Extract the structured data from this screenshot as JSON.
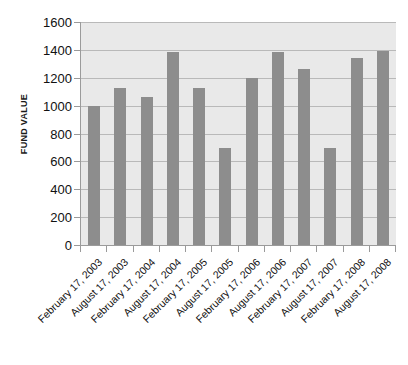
{
  "chart_data": {
    "type": "bar",
    "title": "",
    "xlabel": "",
    "ylabel": "FUND VALUE",
    "ylim": [
      0,
      1600
    ],
    "ytick_step": 200,
    "yticks": [
      0,
      200,
      400,
      600,
      800,
      1000,
      1200,
      1400,
      1600
    ],
    "grid": true,
    "legend": null,
    "categories": [
      "February 17, 2003",
      "August 17, 2003",
      "February 17, 2004",
      "August 17, 2004",
      "February 17, 2005",
      "August 17, 2005",
      "February 17, 2006",
      "August 17, 2006",
      "February 17, 2007",
      "August 17, 2007",
      "February 17, 2008",
      "August 17, 2008"
    ],
    "values": [
      1000,
      1130,
      1065,
      1385,
      1130,
      695,
      1200,
      1385,
      1265,
      695,
      1345,
      1390
    ],
    "colors": {
      "bar": "#8d8d8d",
      "plot_background": "#e9e9e9",
      "gridline": "#b9b9b9",
      "axis": "#9b9b9b",
      "text": "#111111",
      "page_background": "#ffffff"
    }
  }
}
